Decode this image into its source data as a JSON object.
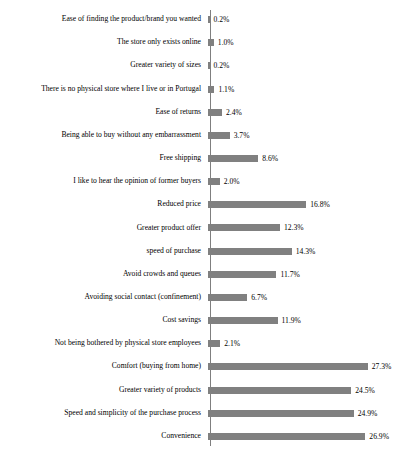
{
  "chart_data": {
    "type": "bar",
    "orientation": "horizontal",
    "title": "",
    "xlabel": "",
    "ylabel": "",
    "grid": false,
    "legend": false,
    "xlim": [
      0,
      30
    ],
    "bar_color": "#808080",
    "categories": [
      "Ease of finding the product/brand you wanted",
      "The store only exists online",
      "Greater variety of sizes",
      "There is no physical store where I live or in Portugal",
      "Ease of returns",
      "Being able to buy without any embarrassment",
      "Free shipping",
      "I like to hear the opinion of former buyers",
      "Reduced price",
      "Greater product offer",
      "speed of purchase",
      "Avoid crowds and queues",
      "Avoiding social contact (confinement)",
      "Cost savings",
      "Not being bothered by physical store employees",
      "Comfort (buying from home)",
      "Greater variety of products",
      "Speed and simplicity of the purchase process",
      "Convenience"
    ],
    "values": [
      0.2,
      1.0,
      0.2,
      1.1,
      2.4,
      3.7,
      8.6,
      2.0,
      16.8,
      12.3,
      14.3,
      11.7,
      6.7,
      11.9,
      2.1,
      27.3,
      24.5,
      24.9,
      26.9
    ],
    "value_labels": [
      "0.2%",
      "1.0%",
      "0.2%",
      "1.1%",
      "2.4%",
      "3.7%",
      "8.6%",
      "2.0%",
      "16.8%",
      "12.3%",
      "14.3%",
      "11.7%",
      "6.7%",
      "11.9%",
      "2.1%",
      "27.3%",
      "24.5%",
      "24.9%",
      "26.9%"
    ]
  }
}
